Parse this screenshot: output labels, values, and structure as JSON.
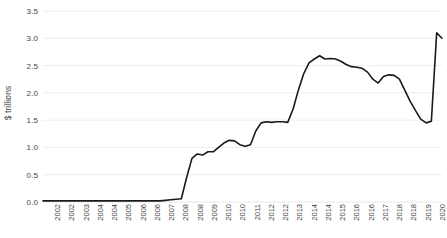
{
  "chart_data": {
    "type": "line",
    "title": "",
    "subtitle": "",
    "xlabel": "",
    "ylabel": "$ trillions",
    "ylim": [
      0.0,
      3.5
    ],
    "yticks": [
      "0.0",
      "0.5",
      "1.0",
      "1.5",
      "2.0",
      "2.5",
      "3.0",
      "3.5"
    ],
    "ytick_values": [
      0.0,
      0.5,
      1.0,
      1.5,
      2.0,
      2.5,
      3.0,
      3.5
    ],
    "grid": true,
    "legend": "none",
    "line_color": "#1a1a1a",
    "grid_color": "#e8e8e8",
    "axis_label_color": "#444444",
    "xtick_labels": [
      "2002",
      "2002",
      "2003",
      "2004",
      "2004",
      "2005",
      "2006",
      "2006",
      "2007",
      "2008",
      "2008",
      "2009",
      "2010",
      "2010",
      "2011",
      "2012",
      "2012",
      "2013",
      "2014",
      "2014",
      "2015",
      "2016",
      "2016",
      "2017",
      "2018",
      "2018",
      "2019",
      "2020"
    ],
    "x": [
      2002.0,
      2002.25,
      2002.5,
      2002.75,
      2003.0,
      2003.25,
      2003.5,
      2003.75,
      2004.0,
      2004.25,
      2004.5,
      2004.75,
      2005.0,
      2005.25,
      2005.5,
      2005.75,
      2006.0,
      2006.25,
      2006.5,
      2006.75,
      2007.0,
      2007.25,
      2007.5,
      2007.75,
      2008.0,
      2008.25,
      2008.5,
      2008.75,
      2009.0,
      2009.25,
      2009.5,
      2009.75,
      2010.0,
      2010.25,
      2010.5,
      2010.75,
      2011.0,
      2011.25,
      2011.5,
      2011.75,
      2012.0,
      2012.25,
      2012.5,
      2012.75,
      2013.0,
      2013.25,
      2013.5,
      2013.75,
      2014.0,
      2014.25,
      2014.5,
      2014.75,
      2015.0,
      2015.25,
      2015.5,
      2015.75,
      2016.0,
      2016.25,
      2016.5,
      2016.75,
      2017.0,
      2017.25,
      2017.5,
      2017.75,
      2018.0,
      2018.25,
      2018.5,
      2018.75,
      2019.0,
      2019.25,
      2019.5,
      2019.75,
      2020.0,
      2020.1,
      2020.2,
      2020.3
    ],
    "values": [
      0.02,
      0.02,
      0.02,
      0.02,
      0.02,
      0.02,
      0.02,
      0.02,
      0.02,
      0.02,
      0.02,
      0.02,
      0.02,
      0.02,
      0.02,
      0.02,
      0.02,
      0.02,
      0.02,
      0.02,
      0.02,
      0.02,
      0.02,
      0.03,
      0.04,
      0.05,
      0.06,
      0.45,
      0.8,
      0.88,
      0.86,
      0.92,
      0.92,
      1.0,
      1.08,
      1.13,
      1.12,
      1.05,
      1.02,
      1.05,
      1.3,
      1.45,
      1.47,
      1.46,
      1.47,
      1.47,
      1.46,
      1.7,
      2.05,
      2.35,
      2.55,
      2.62,
      2.68,
      2.62,
      2.63,
      2.62,
      2.58,
      2.52,
      2.48,
      2.47,
      2.45,
      2.38,
      2.25,
      2.18,
      2.3,
      2.33,
      2.32,
      2.25,
      2.05,
      1.85,
      1.68,
      1.52,
      1.45,
      1.48,
      3.1,
      3.0
    ]
  }
}
